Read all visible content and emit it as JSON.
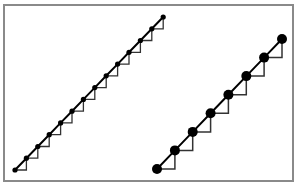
{
  "figure": {
    "frame": {
      "x": 4,
      "y": 5,
      "width": 289,
      "height": 176,
      "stroke": "#8a8a8a",
      "stroke_width": 2
    },
    "colors": {
      "line": "#000000",
      "step": "#333333",
      "dot": "#000000",
      "background": "#ffffff"
    },
    "series": [
      {
        "name": "fine-staircase",
        "dot_radius": 2.6,
        "line_width": 2,
        "step_width": 1.3,
        "points": [
          [
            15,
            170
          ],
          [
            26.4,
            158.2
          ],
          [
            37.8,
            146.5
          ],
          [
            49.2,
            134.7
          ],
          [
            60.6,
            122.9
          ],
          [
            72,
            111.2
          ],
          [
            83.4,
            99.4
          ],
          [
            94.8,
            87.6
          ],
          [
            106.2,
            75.8
          ],
          [
            117.6,
            64.1
          ],
          [
            129,
            52.3
          ],
          [
            140.4,
            40.5
          ],
          [
            151.8,
            28.8
          ],
          [
            163.2,
            17
          ]
        ]
      },
      {
        "name": "coarse-staircase",
        "dot_radius": 5,
        "line_width": 2,
        "step_width": 1.5,
        "points": [
          [
            157,
            169
          ],
          [
            174.9,
            150.4
          ],
          [
            192.7,
            131.9
          ],
          [
            210.6,
            113.3
          ],
          [
            228.4,
            94.7
          ],
          [
            246.3,
            76.1
          ],
          [
            264.1,
            57.6
          ],
          [
            282,
            39
          ]
        ]
      }
    ]
  }
}
